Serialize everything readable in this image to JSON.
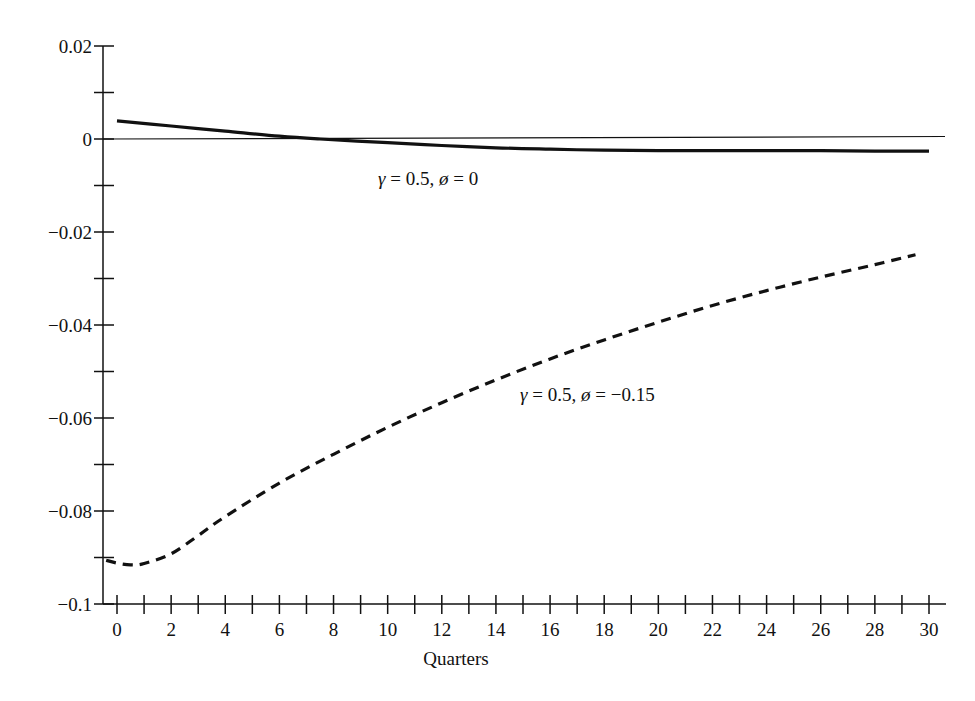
{
  "chart_data": {
    "type": "line",
    "title": "",
    "xlabel": "Quarters",
    "ylabel": "",
    "xlim": [
      0,
      30
    ],
    "ylim": [
      -0.1,
      0.02
    ],
    "grid": false,
    "legend": "none (inline annotations)",
    "x_ticks": [
      0,
      2,
      4,
      6,
      8,
      10,
      12,
      14,
      16,
      18,
      20,
      22,
      24,
      26,
      28,
      30
    ],
    "x_tick_labels": [
      "0",
      "2",
      "4",
      "6",
      "8",
      "10",
      "12",
      "14",
      "16",
      "18",
      "20",
      "22",
      "24",
      "26",
      "28",
      "30"
    ],
    "x_minor_ticks": [
      1,
      3,
      5,
      7,
      9,
      11,
      13,
      15,
      17,
      19,
      21,
      23,
      25,
      27,
      29
    ],
    "y_ticks": [
      0.02,
      0,
      -0.02,
      -0.04,
      -0.06,
      -0.08,
      -0.1
    ],
    "y_tick_labels": [
      "0.02",
      "0",
      "−0.02",
      "−0.04",
      "−0.06",
      "−0.08",
      "−0.1"
    ],
    "y_minor_ticks": [
      0.01,
      -0.01,
      -0.03,
      -0.05,
      -0.07,
      -0.09
    ],
    "reference_line": {
      "y": 0,
      "style": "thin solid"
    },
    "series": [
      {
        "name": "γ = 0.5, φ = 0",
        "style": "solid",
        "x": [
          0,
          2,
          4,
          6,
          7.5,
          10,
          12,
          14,
          16,
          18,
          20,
          22,
          24,
          26,
          28,
          30
        ],
        "values": [
          0.0039,
          0.0028,
          0.0017,
          0.0006,
          0.0,
          -0.0008,
          -0.0014,
          -0.0019,
          -0.0022,
          -0.0024,
          -0.0025,
          -0.0025,
          -0.0025,
          -0.0025,
          -0.0026,
          -0.0026
        ]
      },
      {
        "name": "γ = 0.5, φ = −0.15",
        "style": "dashed",
        "x": [
          -0.4,
          0,
          0.5,
          1,
          2,
          3,
          4,
          6,
          8,
          10,
          12,
          14,
          16,
          18,
          20,
          22,
          24,
          26,
          28,
          29.5
        ],
        "values": [
          -0.0906,
          -0.0912,
          -0.0916,
          -0.0913,
          -0.0892,
          -0.0853,
          -0.0812,
          -0.074,
          -0.0678,
          -0.062,
          -0.0567,
          -0.0518,
          -0.0473,
          -0.0432,
          -0.0394,
          -0.0358,
          -0.0326,
          -0.0297,
          -0.027,
          -0.0249
        ]
      }
    ],
    "annotations": [
      {
        "text_parts": [
          "γ",
          " = 0.5, ",
          "ø",
          " = 0"
        ],
        "x_px": 378,
        "y_px": 185
      },
      {
        "text_parts": [
          "γ",
          " = 0.5, ",
          "ø",
          " = −0.15"
        ],
        "x_px": 520,
        "y_px": 401
      }
    ]
  },
  "layout": {
    "plot_px": {
      "x0": 117,
      "x30": 929,
      "y_axis_x": 103,
      "y_zero": 139,
      "px_per_unit_y": 4650,
      "x_axis_y": 604,
      "x_axis_end": 946,
      "zero_line_end": 945
    },
    "colors": {
      "ink": "#111111",
      "background": "#ffffff"
    }
  }
}
